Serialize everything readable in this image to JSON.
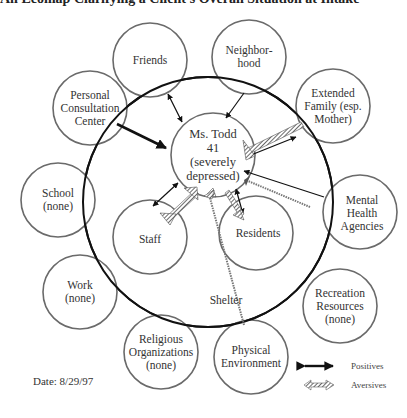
{
  "title": "An Ecomap Clarifying a Client's Overall Situation at Intake",
  "client": {
    "name": "Ms. Todd",
    "age": "41",
    "condition_line1": "(severely",
    "condition_line2": "depressed)"
  },
  "shelter_label": "Shelter",
  "nodes": {
    "friends": {
      "line1": "Friends"
    },
    "neighborhood": {
      "line1": "Neighbor-",
      "line2": "hood"
    },
    "personal_consultation": {
      "line1": "Personal",
      "line2": "Consultation",
      "line3": "Center"
    },
    "extended_family": {
      "line1": "Extended",
      "line2": "Family (esp.",
      "line3": "Mother)"
    },
    "mental_health": {
      "line1": "Mental",
      "line2": "Health",
      "line3": "Agencies"
    },
    "school": {
      "line1": "School",
      "line2": "(none)"
    },
    "work": {
      "line1": "Work",
      "line2": "(none)"
    },
    "recreation": {
      "line1": "Recreation",
      "line2": "Resources",
      "line3": "(none)"
    },
    "religious": {
      "line1": "Religious",
      "line2": "Organizations",
      "line3": "(none)"
    },
    "physical_environment": {
      "line1": "Physical",
      "line2": "Environment"
    },
    "staff": {
      "line1": "Staff"
    },
    "residents": {
      "line1": "Residents"
    }
  },
  "legend": {
    "positives": "Positives",
    "aversives": "Aversives"
  },
  "date": "Date:  8/29/97",
  "colors": {
    "circle_stroke": "#6a6a6a",
    "shelter_stroke": "#111111",
    "arrow": "#111111",
    "aversive": "#555555"
  }
}
